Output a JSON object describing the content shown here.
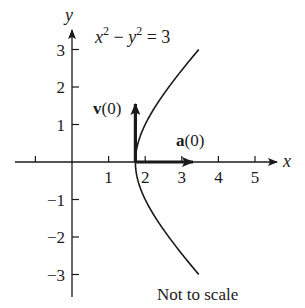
{
  "figure": {
    "equation": {
      "lhs_x": "x",
      "exp1": "2",
      "minus": " − ",
      "lhs_y": "y",
      "exp2": "2",
      "rhs": " = 3"
    },
    "axes": {
      "x_label": "x",
      "y_label": "y",
      "x_ticks": [
        "1",
        "2",
        "3",
        "4",
        "5"
      ],
      "y_ticks": [
        "3",
        "2",
        "1",
        "−1",
        "−2",
        "−3"
      ]
    },
    "vectors": {
      "velocity": {
        "bold": "v",
        "arg": "(0)"
      },
      "acceleration": {
        "bold": "a",
        "arg": "(0)"
      }
    },
    "note": "Not to scale",
    "colors": {
      "ink": "#1a1a1a",
      "background": "#ffffff"
    }
  }
}
